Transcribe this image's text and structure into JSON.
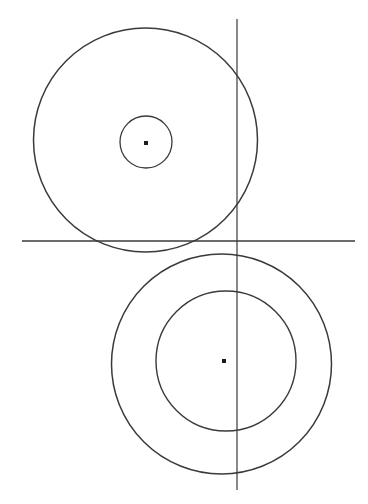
{
  "figure": {
    "canvas": {
      "width": 368,
      "height": 504,
      "background_color": "#ffffff"
    },
    "stroke_color": "#3a3a3a",
    "dot_color": "#1c1c1c",
    "default_stroke_width": 1.3
  },
  "chart_data": {
    "type": "scatter",
    "xlabel": "",
    "ylabel": "",
    "xlim": [
      0,
      368
    ],
    "ylim": [
      504,
      0
    ],
    "grid": false,
    "legend": "none",
    "annotations": [
      "Upper group: large circle with small concentric circle and center point",
      "Lower group: large circle with medium concentric circle and center point",
      "The two large circles are externally tangent near the horizontal line",
      "A vertical line and a horizontal line cross just above the tangency region"
    ],
    "lines": [
      {
        "name": "horizontal-axis",
        "orientation": "horizontal",
        "x1": 22,
        "y1": 241,
        "x2": 355,
        "y2": 241,
        "length": 333,
        "stroke_width": 1.5
      },
      {
        "name": "vertical-axis",
        "orientation": "vertical",
        "x1": 237,
        "y1": 19,
        "x2": 237,
        "y2": 490,
        "length": 471,
        "stroke_width": 1.2
      }
    ],
    "circles": [
      {
        "name": "upper-large-circle",
        "cx": 145.5,
        "cy": 140,
        "r": 112,
        "stroke_width": 1.5
      },
      {
        "name": "upper-small-circle",
        "cx": 146,
        "cy": 142,
        "r": 26,
        "stroke_width": 1.3
      },
      {
        "name": "lower-outer-circle",
        "cx": 221.5,
        "cy": 364,
        "r": 110,
        "stroke_width": 1.5
      },
      {
        "name": "lower-inner-circle",
        "cx": 226,
        "cy": 361,
        "r": 70,
        "stroke_width": 1.4
      }
    ],
    "points": [
      {
        "name": "upper-center-point",
        "x": 146,
        "y": 143,
        "size": 4
      },
      {
        "name": "lower-center-point",
        "x": 224,
        "y": 361,
        "size": 4
      }
    ]
  }
}
